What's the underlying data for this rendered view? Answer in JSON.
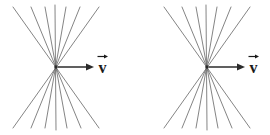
{
  "diagram": {
    "background_color": "#ffffff",
    "line_color": "#6e6e6e",
    "arrow_color": "#2b2b2b",
    "label_color": "#1a1a1a",
    "width": 270,
    "height": 135,
    "figures": [
      {
        "id": "left-figure",
        "name": "Left starburst figure",
        "vertex": {
          "x": 56,
          "y": 67
        },
        "ray_endpoints_top": [
          {
            "x": 13,
            "y": 7
          },
          {
            "x": 31,
            "y": 7
          },
          {
            "x": 45,
            "y": 7
          },
          {
            "x": 55,
            "y": 5
          },
          {
            "x": 66,
            "y": 7
          },
          {
            "x": 80,
            "y": 7
          },
          {
            "x": 99,
            "y": 7
          }
        ],
        "ray_endpoints_bottom": [
          {
            "x": 13,
            "y": 128
          },
          {
            "x": 31,
            "y": 128
          },
          {
            "x": 45,
            "y": 128
          },
          {
            "x": 56,
            "y": 130
          },
          {
            "x": 67,
            "y": 128
          },
          {
            "x": 81,
            "y": 128
          },
          {
            "x": 99,
            "y": 128
          }
        ],
        "vector": {
          "name": "velocity-vector",
          "label": "v",
          "direction": "right",
          "start": {
            "x": 58,
            "y": 67
          },
          "end": {
            "x": 94,
            "y": 67
          },
          "label_position": {
            "x": 99,
            "y": 55
          }
        }
      },
      {
        "id": "right-figure",
        "name": "Right starburst figure",
        "vertex": {
          "x": 207,
          "y": 67
        },
        "ray_endpoints_top": [
          {
            "x": 164,
            "y": 7
          },
          {
            "x": 182,
            "y": 7
          },
          {
            "x": 196,
            "y": 7
          },
          {
            "x": 206,
            "y": 5
          },
          {
            "x": 217,
            "y": 7
          },
          {
            "x": 231,
            "y": 7
          },
          {
            "x": 250,
            "y": 7
          }
        ],
        "ray_endpoints_bottom": [
          {
            "x": 164,
            "y": 128
          },
          {
            "x": 182,
            "y": 128
          },
          {
            "x": 196,
            "y": 128
          },
          {
            "x": 207,
            "y": 130
          },
          {
            "x": 218,
            "y": 128
          },
          {
            "x": 232,
            "y": 128
          },
          {
            "x": 250,
            "y": 128
          }
        ],
        "vector": {
          "name": "velocity-vector",
          "label": "v",
          "direction": "right",
          "start": {
            "x": 209,
            "y": 67
          },
          "end": {
            "x": 245,
            "y": 67
          },
          "label_position": {
            "x": 250,
            "y": 55
          }
        }
      }
    ]
  }
}
